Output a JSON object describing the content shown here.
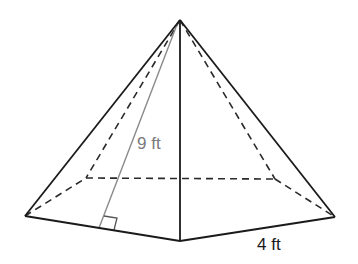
{
  "diagram": {
    "type": "square pyramid",
    "labels": {
      "slant_height": "9 ft",
      "base_edge": "4 ft"
    },
    "colors": {
      "edge": "#1a1a1a",
      "hidden_edge": "#2a2a2a",
      "slant_line": "#8a8a8a",
      "slant_label": "#7a7a7a",
      "background": "#ffffff"
    },
    "points": {
      "apex": [
        180,
        20
      ],
      "base_left": [
        25,
        216
      ],
      "base_front": [
        180,
        241
      ],
      "base_right": [
        335,
        217
      ],
      "base_back_left": [
        86,
        178
      ],
      "base_back_right": [
        275,
        179
      ],
      "slant_foot": [
        99,
        228
      ]
    },
    "visible_edges": [
      [
        "apex",
        "base_left"
      ],
      [
        "apex",
        "base_front"
      ],
      [
        "apex",
        "base_right"
      ],
      [
        "base_left",
        "base_front"
      ],
      [
        "base_front",
        "base_right"
      ]
    ],
    "hidden_edges": [
      [
        "apex",
        "base_back_left"
      ],
      [
        "apex",
        "base_back_right"
      ],
      [
        "base_left",
        "base_back_left"
      ],
      [
        "base_back_left",
        "base_back_right"
      ],
      [
        "base_back_right",
        "base_right"
      ]
    ],
    "right_angle_marker": true
  }
}
